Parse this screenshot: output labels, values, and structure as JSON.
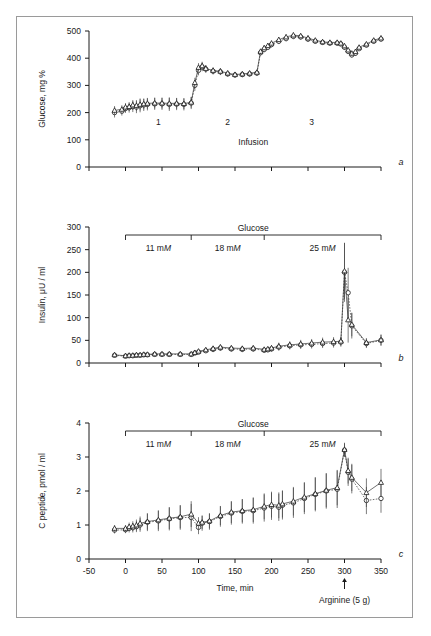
{
  "figure": {
    "frame_border_color": "#9a9a9a",
    "background": "#ffffff",
    "panel_letters": {
      "a": "a",
      "b": "b",
      "c": "c"
    }
  },
  "shared": {
    "bracket_title": "Glucose",
    "bracket_segments": [
      {
        "label_num": "11",
        "label_unit": "m",
        "label_ital": "M",
        "x_start": 0,
        "x_end": 90
      },
      {
        "label_num": "18",
        "label_unit": "m",
        "label_ital": "M",
        "x_start": 90,
        "x_end": 190
      },
      {
        "label_num": "25",
        "label_unit": "m",
        "label_ital": "M",
        "x_start": 190,
        "x_end": 350
      }
    ],
    "xaxis_label": "Time, min",
    "xticks": [
      -50,
      0,
      50,
      100,
      150,
      200,
      250,
      300,
      350
    ],
    "xlim": [
      -50,
      350
    ],
    "annotation": {
      "text": "Arginine (5 g)",
      "x": 300,
      "arrow": "up-arrow-icon"
    }
  },
  "chart_data": [
    {
      "id": "panel-a",
      "type": "line",
      "title": "",
      "panel_letter": "a",
      "xlabel": "",
      "ylabel": "Glucose, mg %",
      "ylim": [
        0,
        500
      ],
      "yticks": [
        0,
        100,
        200,
        300,
        400,
        500
      ],
      "xlim": [
        -50,
        350
      ],
      "xticks": [
        -50,
        0,
        50,
        100,
        150,
        200,
        250,
        300,
        350
      ],
      "grid": false,
      "legend": "none",
      "inner_label": "Infusion",
      "phase_labels": [
        {
          "text": "1",
          "x": 45
        },
        {
          "text": "2",
          "x": 140
        },
        {
          "text": "3",
          "x": 255
        }
      ],
      "series": [
        {
          "name": "circles",
          "marker": "open-circle",
          "x": [
            -15,
            -5,
            0,
            5,
            10,
            15,
            20,
            25,
            30,
            40,
            50,
            60,
            70,
            80,
            90,
            95,
            100,
            105,
            110,
            120,
            130,
            140,
            150,
            160,
            170,
            180,
            185,
            190,
            195,
            200,
            210,
            220,
            230,
            240,
            250,
            260,
            270,
            280,
            290,
            295,
            300,
            305,
            310,
            315,
            320,
            330,
            340,
            350
          ],
          "values": [
            200,
            205,
            215,
            218,
            222,
            220,
            225,
            228,
            230,
            232,
            232,
            230,
            231,
            230,
            235,
            300,
            355,
            368,
            360,
            352,
            350,
            342,
            338,
            340,
            342,
            345,
            420,
            432,
            440,
            450,
            462,
            472,
            480,
            478,
            470,
            462,
            458,
            455,
            455,
            452,
            440,
            425,
            412,
            418,
            435,
            448,
            462,
            470
          ],
          "errors": [
            18,
            16,
            16,
            18,
            20,
            22,
            24,
            22,
            22,
            22,
            22,
            24,
            22,
            22,
            22,
            20,
            18,
            16,
            14,
            12,
            12,
            10,
            10,
            10,
            10,
            10,
            10,
            10,
            10,
            10,
            10,
            10,
            10,
            10,
            10,
            8,
            8,
            8,
            8,
            8,
            10,
            10,
            10,
            10,
            8,
            8,
            8,
            8
          ]
        },
        {
          "name": "triangles",
          "marker": "open-triangle",
          "x": [
            -15,
            -5,
            0,
            5,
            10,
            15,
            20,
            25,
            30,
            40,
            50,
            60,
            70,
            80,
            90,
            95,
            100,
            105,
            110,
            120,
            130,
            140,
            150,
            160,
            170,
            180,
            185,
            190,
            195,
            200,
            210,
            220,
            230,
            240,
            250,
            260,
            270,
            280,
            290,
            295,
            300,
            305,
            310,
            315,
            320,
            330,
            340,
            350
          ],
          "values": [
            208,
            212,
            220,
            222,
            228,
            226,
            230,
            232,
            234,
            235,
            235,
            234,
            234,
            233,
            238,
            310,
            366,
            372,
            362,
            355,
            352,
            345,
            340,
            342,
            345,
            348,
            425,
            438,
            446,
            455,
            468,
            478,
            485,
            482,
            474,
            466,
            460,
            458,
            458,
            455,
            445,
            430,
            418,
            424,
            440,
            452,
            466,
            474
          ],
          "errors": [
            16,
            15,
            15,
            16,
            18,
            20,
            22,
            20,
            20,
            20,
            20,
            22,
            20,
            20,
            20,
            18,
            16,
            15,
            13,
            11,
            11,
            10,
            9,
            9,
            9,
            9,
            9,
            9,
            9,
            9,
            9,
            9,
            9,
            9,
            9,
            8,
            8,
            8,
            8,
            8,
            9,
            9,
            9,
            9,
            8,
            8,
            8,
            8
          ]
        }
      ]
    },
    {
      "id": "panel-b",
      "type": "line",
      "panel_letter": "b",
      "xlabel": "",
      "ylabel": "Insulin, μU / ml",
      "ylim": [
        0,
        300
      ],
      "yticks": [
        0,
        50,
        100,
        150,
        200,
        250,
        300
      ],
      "xlim": [
        -50,
        350
      ],
      "xticks": [
        -50,
        0,
        50,
        100,
        150,
        200,
        250,
        300,
        350
      ],
      "grid": false,
      "series": [
        {
          "name": "circles",
          "marker": "open-circle",
          "x": [
            -15,
            0,
            5,
            10,
            15,
            20,
            25,
            30,
            40,
            50,
            60,
            75,
            90,
            95,
            100,
            110,
            120,
            130,
            145,
            160,
            175,
            190,
            195,
            200,
            210,
            225,
            240,
            255,
            270,
            285,
            295,
            300,
            305,
            310,
            330,
            350
          ],
          "values": [
            17,
            15,
            16,
            16,
            17,
            17,
            18,
            18,
            19,
            19,
            19,
            19,
            19,
            22,
            24,
            27,
            30,
            33,
            31,
            30,
            31,
            28,
            29,
            31,
            35,
            38,
            40,
            41,
            43,
            44,
            46,
            200,
            155,
            82,
            43,
            50
          ],
          "errors": [
            3,
            3,
            3,
            3,
            3,
            3,
            3,
            3,
            3,
            3,
            3,
            3,
            3,
            4,
            4,
            5,
            6,
            6,
            6,
            6,
            6,
            5,
            5,
            6,
            8,
            8,
            9,
            9,
            10,
            10,
            10,
            65,
            55,
            28,
            10,
            12
          ]
        },
        {
          "name": "triangles",
          "marker": "open-triangle",
          "x": [
            -15,
            0,
            5,
            10,
            15,
            20,
            25,
            30,
            40,
            50,
            60,
            75,
            90,
            95,
            100,
            110,
            120,
            130,
            145,
            160,
            175,
            190,
            195,
            200,
            210,
            225,
            240,
            255,
            270,
            285,
            295,
            300,
            305,
            310,
            330,
            350
          ],
          "values": [
            18,
            16,
            17,
            17,
            18,
            18,
            19,
            19,
            20,
            20,
            20,
            20,
            20,
            23,
            26,
            29,
            32,
            35,
            33,
            32,
            33,
            30,
            31,
            33,
            37,
            40,
            42,
            44,
            46,
            47,
            48,
            203,
            95,
            85,
            45,
            51
          ],
          "errors": [
            3,
            3,
            3,
            3,
            3,
            3,
            3,
            3,
            3,
            3,
            3,
            3,
            3,
            4,
            4,
            5,
            6,
            6,
            6,
            6,
            6,
            5,
            5,
            6,
            8,
            8,
            9,
            9,
            10,
            10,
            10,
            62,
            50,
            26,
            10,
            12
          ]
        }
      ]
    },
    {
      "id": "panel-c",
      "type": "line",
      "panel_letter": "c",
      "xlabel": "Time, min",
      "ylabel": "C peptide, pmol / ml",
      "ylim": [
        0,
        4
      ],
      "yticks": [
        0,
        1,
        2,
        3,
        4
      ],
      "xlim": [
        -50,
        350
      ],
      "xticks": [
        -50,
        0,
        50,
        100,
        150,
        200,
        250,
        300,
        350
      ],
      "grid": false,
      "series": [
        {
          "name": "circles",
          "marker": "open-circle",
          "x": [
            -15,
            0,
            5,
            10,
            15,
            20,
            30,
            45,
            60,
            75,
            90,
            100,
            105,
            115,
            130,
            145,
            160,
            175,
            190,
            200,
            210,
            215,
            230,
            245,
            260,
            275,
            290,
            300,
            305,
            310,
            330,
            350
          ],
          "values": [
            0.85,
            0.86,
            0.9,
            0.92,
            0.95,
            1.0,
            1.08,
            1.12,
            1.18,
            1.22,
            1.22,
            0.93,
            1.05,
            1.1,
            1.25,
            1.35,
            1.4,
            1.42,
            1.5,
            1.55,
            1.52,
            1.58,
            1.65,
            1.78,
            1.9,
            2.0,
            2.05,
            3.2,
            2.55,
            2.35,
            1.72,
            1.78
          ],
          "errors": [
            0.1,
            0.1,
            0.12,
            0.14,
            0.16,
            0.2,
            0.26,
            0.3,
            0.34,
            0.36,
            0.4,
            0.2,
            0.22,
            0.24,
            0.3,
            0.34,
            0.36,
            0.38,
            0.4,
            0.4,
            0.4,
            0.42,
            0.44,
            0.46,
            0.5,
            0.52,
            0.55,
            0.2,
            0.4,
            0.42,
            0.4,
            0.42
          ]
        },
        {
          "name": "triangles",
          "marker": "open-triangle",
          "x": [
            -15,
            0,
            5,
            10,
            15,
            20,
            30,
            45,
            60,
            75,
            90,
            100,
            105,
            115,
            130,
            145,
            160,
            175,
            190,
            200,
            210,
            215,
            230,
            245,
            260,
            275,
            290,
            300,
            305,
            310,
            330,
            350
          ],
          "values": [
            0.9,
            0.9,
            0.95,
            0.97,
            1.0,
            1.05,
            1.1,
            1.15,
            1.2,
            1.24,
            1.32,
            1.05,
            1.08,
            1.12,
            1.28,
            1.38,
            1.42,
            1.45,
            1.55,
            1.6,
            1.58,
            1.62,
            1.7,
            1.82,
            1.92,
            2.02,
            2.1,
            3.22,
            2.6,
            2.4,
            1.95,
            2.25
          ],
          "errors": [
            0.1,
            0.1,
            0.12,
            0.14,
            0.16,
            0.2,
            0.24,
            0.28,
            0.32,
            0.34,
            0.38,
            0.18,
            0.2,
            0.22,
            0.28,
            0.32,
            0.34,
            0.36,
            0.38,
            0.38,
            0.38,
            0.4,
            0.42,
            0.44,
            0.48,
            0.5,
            0.52,
            0.2,
            0.38,
            0.4,
            0.42,
            0.4
          ]
        }
      ]
    }
  ]
}
